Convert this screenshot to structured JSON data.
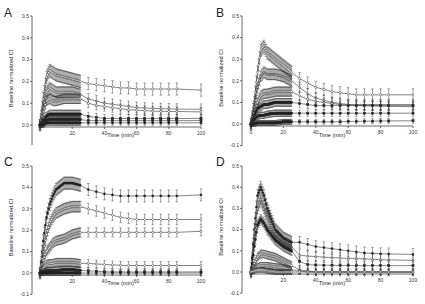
{
  "figure": {
    "caption_fragment": ""
  },
  "chart_data": [
    {
      "panel": "A",
      "type": "line",
      "title": "",
      "xlabel": "Time (min)",
      "ylabel": "Baseline normalized CI",
      "xlim": [
        0,
        100
      ],
      "ylim": [
        0.0,
        0.5
      ],
      "xticks": [
        20,
        40,
        60,
        80,
        100
      ],
      "yticks": [
        0.0,
        0.1,
        0.2,
        0.3,
        0.4,
        0.5
      ],
      "ytick_labels": [
        "0.0",
        "0.1",
        "0.2",
        "0.3",
        "0.4",
        "0.5"
      ],
      "grid": false,
      "error_bars": true,
      "x": [
        0,
        2,
        4,
        6,
        8,
        10,
        15,
        20,
        25,
        30,
        35,
        40,
        45,
        50,
        55,
        60,
        65,
        70,
        75,
        80,
        85,
        100
      ],
      "series": [
        {
          "name": "s1",
          "marker": "open-diamond",
          "values": [
            0.0,
            0.12,
            0.22,
            0.25,
            0.24,
            0.23,
            0.22,
            0.21,
            0.2,
            0.19,
            0.185,
            0.18,
            0.175,
            0.17,
            0.17,
            0.165,
            0.165,
            0.165,
            0.165,
            0.165,
            0.165,
            0.16
          ]
        },
        {
          "name": "s2",
          "marker": "open-diamond",
          "values": [
            0.0,
            0.08,
            0.15,
            0.17,
            0.16,
            0.15,
            0.15,
            0.15,
            0.14,
            0.12,
            0.11,
            0.1,
            0.095,
            0.09,
            0.085,
            0.08,
            0.078,
            0.076,
            0.075,
            0.074,
            0.073,
            0.072
          ]
        },
        {
          "name": "s3",
          "marker": "open-circle",
          "values": [
            0.0,
            0.06,
            0.11,
            0.12,
            0.11,
            0.11,
            0.12,
            0.12,
            0.12,
            0.1,
            0.09,
            0.085,
            0.08,
            0.075,
            0.07,
            0.068,
            0.066,
            0.064,
            0.063,
            0.062,
            0.062,
            0.06
          ]
        },
        {
          "name": "s4",
          "marker": "filled-square",
          "values": [
            0.0,
            0.02,
            0.04,
            0.05,
            0.05,
            0.05,
            0.05,
            0.05,
            0.05,
            0.04,
            0.035,
            0.03,
            0.03,
            0.03,
            0.03,
            0.03,
            0.03,
            0.03,
            0.03,
            0.03,
            0.03,
            0.03
          ]
        },
        {
          "name": "s5",
          "marker": "filled-square",
          "values": [
            0.0,
            0.01,
            0.02,
            0.025,
            0.025,
            0.025,
            0.025,
            0.025,
            0.025,
            0.02,
            0.02,
            0.02,
            0.02,
            0.02,
            0.02,
            0.02,
            0.02,
            0.02,
            0.02,
            0.02,
            0.02,
            0.02
          ]
        },
        {
          "name": "s6",
          "marker": "filled-circle",
          "values": [
            0.0,
            0.0,
            0.01,
            0.01,
            0.01,
            0.01,
            0.01,
            0.01,
            0.01,
            0.01,
            0.01,
            0.01,
            0.01,
            0.01,
            0.01,
            0.01,
            0.01,
            0.01,
            0.01,
            0.01,
            0.01,
            0.01
          ]
        }
      ]
    },
    {
      "panel": "B",
      "type": "line",
      "title": "",
      "xlabel": "Time (min)",
      "ylabel": "Baseline normalized CI",
      "xlim": [
        0,
        100
      ],
      "ylim": [
        -0.1,
        0.5
      ],
      "xticks": [
        0,
        20,
        40,
        60,
        80,
        100
      ],
      "yticks": [
        -0.1,
        0.0,
        0.1,
        0.2,
        0.3,
        0.4,
        0.5
      ],
      "ytick_labels": [
        "-0.1",
        "0.0",
        "0.1",
        "0.2",
        "0.3",
        "0.4",
        "0.5"
      ],
      "grid": false,
      "error_bars": true,
      "x": [
        0,
        2,
        4,
        6,
        8,
        10,
        15,
        20,
        25,
        30,
        35,
        40,
        45,
        50,
        55,
        60,
        65,
        70,
        75,
        80,
        85,
        100
      ],
      "series": [
        {
          "name": "s1",
          "marker": "open-diamond",
          "values": [
            0.0,
            0.1,
            0.24,
            0.34,
            0.36,
            0.33,
            0.3,
            0.27,
            0.24,
            0.21,
            0.19,
            0.17,
            0.16,
            0.15,
            0.145,
            0.14,
            0.135,
            0.135,
            0.135,
            0.135,
            0.135,
            0.135
          ]
        },
        {
          "name": "s2",
          "marker": "open-triangle",
          "values": [
            0.0,
            0.08,
            0.17,
            0.22,
            0.24,
            0.23,
            0.23,
            0.22,
            0.2,
            0.17,
            0.14,
            0.12,
            0.11,
            0.1,
            0.095,
            0.09,
            0.09,
            0.09,
            0.09,
            0.09,
            0.09,
            0.09
          ]
        },
        {
          "name": "s3",
          "marker": "open-circle",
          "values": [
            0.0,
            0.05,
            0.1,
            0.13,
            0.14,
            0.14,
            0.15,
            0.15,
            0.15,
            0.13,
            0.115,
            0.105,
            0.1,
            0.095,
            0.09,
            0.088,
            0.086,
            0.085,
            0.084,
            0.083,
            0.082,
            0.08
          ]
        },
        {
          "name": "s4",
          "marker": "filled-square",
          "values": [
            0.0,
            0.04,
            0.07,
            0.08,
            0.09,
            0.09,
            0.1,
            0.1,
            0.1,
            0.095,
            0.09,
            0.085,
            0.085,
            0.085,
            0.085,
            0.085,
            0.085,
            0.085,
            0.085,
            0.085,
            0.085,
            0.085
          ]
        },
        {
          "name": "s5",
          "marker": "filled-square",
          "values": [
            0.0,
            0.02,
            0.035,
            0.04,
            0.04,
            0.045,
            0.05,
            0.05,
            0.05,
            0.05,
            0.05,
            0.05,
            0.05,
            0.05,
            0.05,
            0.05,
            0.05,
            0.05,
            0.05,
            0.05,
            0.05,
            0.05
          ]
        },
        {
          "name": "s6",
          "marker": "filled-square",
          "values": [
            0.0,
            0.0,
            0.005,
            0.005,
            0.005,
            0.005,
            0.005,
            0.01,
            0.01,
            0.01,
            0.01,
            0.01,
            0.01,
            0.01,
            0.01,
            0.012,
            0.012,
            0.013,
            0.013,
            0.014,
            0.014,
            0.015
          ]
        }
      ]
    },
    {
      "panel": "C",
      "type": "line",
      "title": "",
      "xlabel": "Time (min)",
      "ylabel": "Baseline normalized CI",
      "xlim": [
        0,
        100
      ],
      "ylim": [
        -0.1,
        0.5
      ],
      "xticks": [
        20,
        40,
        60,
        80,
        100
      ],
      "yticks": [
        -0.1,
        0.0,
        0.1,
        0.2,
        0.3,
        0.4,
        0.5
      ],
      "ytick_labels": [
        "-0.1",
        "0.0",
        "0.1",
        "0.2",
        "0.3",
        "0.4",
        "0.5"
      ],
      "grid": false,
      "error_bars": true,
      "x": [
        0,
        2,
        4,
        6,
        8,
        10,
        15,
        20,
        25,
        30,
        35,
        40,
        45,
        50,
        55,
        60,
        65,
        70,
        75,
        80,
        85,
        100
      ],
      "series": [
        {
          "name": "s1",
          "marker": "filled-circle",
          "values": [
            0.0,
            0.15,
            0.26,
            0.32,
            0.36,
            0.39,
            0.42,
            0.42,
            0.41,
            0.39,
            0.38,
            0.37,
            0.365,
            0.36,
            0.36,
            0.36,
            0.36,
            0.36,
            0.36,
            0.36,
            0.36,
            0.365
          ]
        },
        {
          "name": "s2",
          "marker": "open-diamond",
          "values": [
            0.0,
            0.1,
            0.18,
            0.23,
            0.26,
            0.28,
            0.3,
            0.31,
            0.31,
            0.3,
            0.29,
            0.28,
            0.27,
            0.26,
            0.255,
            0.25,
            0.25,
            0.25,
            0.25,
            0.25,
            0.25,
            0.25
          ]
        },
        {
          "name": "s3",
          "marker": "open-circle",
          "values": [
            0.0,
            0.06,
            0.1,
            0.12,
            0.14,
            0.15,
            0.16,
            0.18,
            0.19,
            0.19,
            0.19,
            0.19,
            0.19,
            0.19,
            0.19,
            0.19,
            0.19,
            0.19,
            0.19,
            0.19,
            0.19,
            0.195
          ]
        },
        {
          "name": "s4",
          "marker": "open-circle",
          "values": [
            0.0,
            0.02,
            0.04,
            0.045,
            0.045,
            0.05,
            0.05,
            0.05,
            0.045,
            0.045,
            0.042,
            0.04,
            0.038,
            0.036,
            0.035,
            0.035,
            0.035,
            0.035,
            0.035,
            0.035,
            0.035,
            0.035
          ]
        },
        {
          "name": "s5",
          "marker": "filled-square",
          "values": [
            0.0,
            0.005,
            0.01,
            0.01,
            0.01,
            0.012,
            0.015,
            0.015,
            0.012,
            0.01,
            0.008,
            0.006,
            0.005,
            0.005,
            0.005,
            0.005,
            0.005,
            0.005,
            0.005,
            0.005,
            0.005,
            0.005
          ]
        },
        {
          "name": "s6",
          "marker": "filled-circle",
          "values": [
            0.0,
            0.0,
            0.0,
            0.0,
            0.0,
            0.0,
            0.0,
            0.0,
            0.0,
            0.0,
            0.0,
            0.0,
            0.0,
            0.0,
            0.0,
            0.0,
            0.0,
            0.0,
            0.0,
            0.0,
            0.0,
            0.0
          ]
        }
      ]
    },
    {
      "panel": "D",
      "type": "line",
      "title": "",
      "xlabel": "Time (min)",
      "ylabel": "Baseline normalized CI",
      "xlim": [
        0,
        100
      ],
      "ylim": [
        -0.1,
        0.5
      ],
      "xticks": [
        20,
        40,
        60,
        80,
        100
      ],
      "yticks": [
        -0.1,
        0.0,
        0.1,
        0.2,
        0.3,
        0.4,
        0.5
      ],
      "ytick_labels": [
        "-0.1",
        "0.0",
        "0.1",
        "0.2",
        "0.3",
        "0.4",
        "0.5"
      ],
      "grid": false,
      "error_bars": true,
      "x": [
        0,
        2,
        4,
        6,
        8,
        10,
        15,
        20,
        25,
        30,
        35,
        40,
        45,
        50,
        55,
        60,
        65,
        70,
        75,
        80,
        85,
        100
      ],
      "series": [
        {
          "name": "s1",
          "marker": "filled-circle",
          "values": [
            0.0,
            0.2,
            0.36,
            0.4,
            0.36,
            0.3,
            0.2,
            0.16,
            0.14,
            0.14,
            0.13,
            0.12,
            0.115,
            0.11,
            0.105,
            0.1,
            0.095,
            0.09,
            0.088,
            0.086,
            0.085,
            0.083
          ]
        },
        {
          "name": "s2",
          "marker": "open-triangle",
          "values": [
            0.0,
            0.15,
            0.3,
            0.34,
            0.3,
            0.26,
            0.18,
            0.14,
            0.12,
            0.08,
            0.075,
            0.073,
            0.07,
            0.068,
            0.066,
            0.064,
            0.063,
            0.062,
            0.06,
            0.058,
            0.057,
            0.055
          ]
        },
        {
          "name": "s3",
          "marker": "filled-square",
          "values": [
            0.0,
            0.12,
            0.22,
            0.25,
            0.23,
            0.2,
            0.15,
            0.12,
            0.1,
            0.05,
            0.035,
            0.033,
            0.032,
            0.032,
            0.031,
            0.031,
            0.03,
            0.03,
            0.03,
            0.03,
            0.03,
            0.03
          ]
        },
        {
          "name": "s4",
          "marker": "open-circle",
          "values": [
            0.0,
            0.04,
            0.07,
            0.085,
            0.085,
            0.08,
            0.07,
            0.05,
            0.03,
            0.01,
            0.005,
            0.0,
            0.0,
            0.0,
            0.0,
            0.0,
            0.0,
            0.0,
            0.0,
            0.0,
            0.0,
            0.0
          ]
        },
        {
          "name": "s5",
          "marker": "open-diamond",
          "values": [
            0.0,
            0.015,
            0.025,
            0.03,
            0.03,
            0.03,
            0.025,
            0.02,
            0.01,
            0.005,
            0.0,
            0.0,
            0.0,
            0.0,
            0.0,
            0.0,
            0.0,
            0.0,
            0.0,
            0.0,
            0.0,
            0.0
          ]
        },
        {
          "name": "s6",
          "marker": "open-circle",
          "values": [
            0.0,
            0.005,
            0.01,
            0.01,
            0.01,
            0.005,
            0.0,
            0.0,
            0.0,
            0.0,
            0.0,
            0.0,
            0.0,
            0.0,
            0.0,
            0.0,
            0.0,
            0.0,
            0.0,
            0.0,
            0.0,
            0.0
          ]
        }
      ]
    }
  ],
  "layout": {
    "panels": [
      {
        "letter": "A",
        "left": 0,
        "top": 0,
        "axis_x": 32,
        "x0": 40,
        "x100": 201,
        "y_top_val": 0.5,
        "y_top_px": 16,
        "y_zero_px": 125,
        "y_bottom_val": 0.0,
        "axis_bottom_px": 145,
        "xlabel_y": 137
      },
      {
        "letter": "B",
        "left": 0,
        "top": 0,
        "axis_x": 242,
        "x0": 251,
        "x100": 413,
        "y_top_val": 0.5,
        "y_top_px": 16,
        "y_zero_px": 124,
        "y_bottom_val": -0.1,
        "axis_bottom_px": 146,
        "xlabel_y": 137
      },
      {
        "letter": "C",
        "left": 0,
        "top": 0,
        "axis_x": 32,
        "x0": 40,
        "x100": 201,
        "y_top_val": 0.5,
        "y_top_px": 166,
        "y_zero_px": 273,
        "y_bottom_val": -0.1,
        "axis_bottom_px": 295,
        "xlabel_y": 285
      },
      {
        "letter": "D",
        "left": 0,
        "top": 0,
        "axis_x": 242,
        "x0": 251,
        "x100": 413,
        "y_top_val": 0.5,
        "y_top_px": 166,
        "y_zero_px": 272,
        "y_bottom_val": -0.1,
        "axis_bottom_px": 294,
        "xlabel_y": 285
      }
    ],
    "colors": {
      "ink": "#222222",
      "line": "#333333",
      "axis": "#444444",
      "tick_text": "#333333"
    }
  }
}
